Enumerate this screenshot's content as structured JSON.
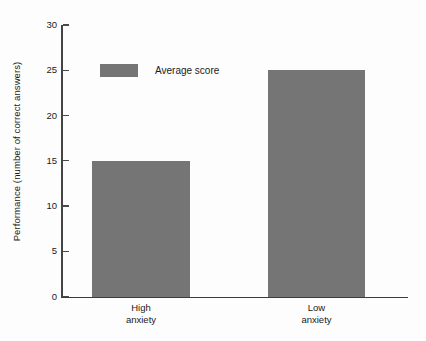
{
  "chart_data": {
    "type": "bar",
    "title": "",
    "subtitle": "",
    "xlabel": "",
    "ylabel": "Performance (number of correct answers)",
    "categories": [
      "High anxiety",
      "Low anxiety"
    ],
    "category_lines": [
      [
        "High",
        "anxiety"
      ],
      [
        "Low",
        "anxiety"
      ]
    ],
    "values": [
      15,
      25
    ],
    "series": [
      {
        "name": "Average score",
        "values": [
          15,
          25
        ]
      }
    ],
    "ylim": [
      0,
      30
    ],
    "yticks": [
      0,
      5,
      10,
      15,
      20,
      25,
      30
    ],
    "ytick_labels": [
      "0",
      "5",
      "10",
      "15",
      "20",
      "25",
      "30"
    ],
    "grid": false,
    "legend": {
      "position": "top-left-inside",
      "entries": [
        {
          "label": "Average score",
          "color": "#757575"
        }
      ]
    },
    "colors": {
      "bar": "#757575",
      "axis": "#3c3c3c",
      "text": "#1a1a1a",
      "background": "#fdfdfd"
    }
  }
}
